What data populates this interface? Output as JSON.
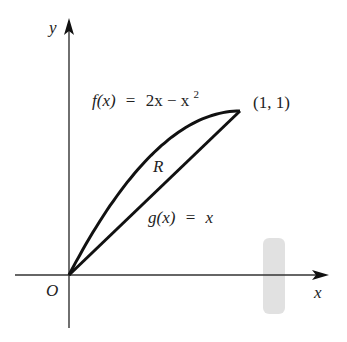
{
  "diagram": {
    "axes": {
      "x_label": "x",
      "y_label": "y",
      "origin_label": "O"
    },
    "curves": [
      {
        "name": "f",
        "label_lhs": "f(x)",
        "label_eq": "=",
        "label_rhs": "2x − x",
        "label_exp": "2",
        "expression": "2x - x^2"
      },
      {
        "name": "g",
        "label_lhs": "g(x)",
        "label_eq": "=",
        "label_rhs": "x",
        "expression": "x"
      }
    ],
    "region_label": "R",
    "intersection_point_label": "(1, 1)",
    "colors": {
      "curve": "#111111",
      "axis": "#333333",
      "text": "#222222",
      "smudge": "#d6d6d6"
    }
  }
}
